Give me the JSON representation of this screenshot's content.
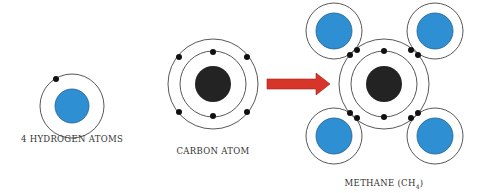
{
  "colors": {
    "hydrogen_nucleus": "#2f8fd3",
    "carbon_nucleus": "#232323",
    "electron": "#111111",
    "orbit": "#444444",
    "arrow": "#d8352a",
    "arrow_stroke": "#a52218"
  },
  "labels": {
    "hydrogen": "4 HYDROGEN ATOMS",
    "carbon": "CARBON ATOM",
    "methane": "METHANE (CH",
    "methane_sub": "4",
    "methane_close": ")"
  }
}
